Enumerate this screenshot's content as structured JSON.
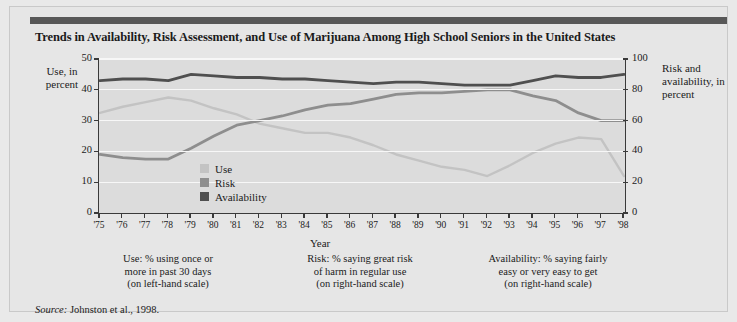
{
  "title": "Trends in Availability, Risk Assessment, and Use of Marijuana Among High School Seniors in the United States",
  "source_prefix": "Source:",
  "source_text": "Johnston et al., 1998.",
  "axis": {
    "left_label": "Use, in percent",
    "right_label": "Risk and availability, in percent",
    "x_label": "Year"
  },
  "legend": [
    {
      "label": "Use",
      "color": "#c3c3c3"
    },
    {
      "label": "Risk",
      "color": "#8e8e8e"
    },
    {
      "label": "Availability",
      "color": "#4f4f4f"
    }
  ],
  "captions": [
    "Use: % using once or more in past 30 days (on left-hand scale)",
    "Risk: % saying great risk of harm in regular use (on right-hand scale)",
    "Availability: % saying fairly easy or very easy to get (on right-hand scale)"
  ],
  "caption_lines": [
    [
      "Use: % using once or",
      "more in past 30 days",
      "(on left-hand scale)"
    ],
    [
      "Risk: % saying great risk",
      "of harm in regular use",
      "(on right-hand scale)"
    ],
    [
      "Availability: % saying fairly",
      "easy or very easy to get",
      "(on right-hand scale)"
    ]
  ],
  "chart_data": {
    "type": "line",
    "title": "Trends in Availability, Risk Assessment, and Use of Marijuana Among High School Seniors in the United States",
    "xlabel": "Year",
    "ylabel": "Use, in percent",
    "ylabel_right": "Risk and availability, in percent",
    "grid": true,
    "legend_position": "inside-center-left",
    "categories": [
      "'75",
      "'76",
      "'77",
      "'78",
      "'79",
      "'80",
      "'81",
      "'82",
      "'83",
      "'84",
      "'85",
      "'86",
      "'87",
      "'88",
      "'89",
      "'90",
      "'91",
      "'92",
      "'93",
      "'94",
      "'95",
      "'96",
      "'97",
      "'98"
    ],
    "x_tick_labels": [
      "'75",
      "'76",
      "'77",
      "'78",
      "'79",
      "'80",
      "'81",
      "'82",
      "'83",
      "'84",
      "'85",
      "'86",
      "'87",
      "'88",
      "'89",
      "'90",
      "'91",
      "'92",
      "'93",
      "'94",
      "'95",
      "'96",
      "'97",
      "'98"
    ],
    "ylim": [
      0,
      50
    ],
    "y_ticks": [
      0,
      10,
      20,
      30,
      40,
      50
    ],
    "ylim_right": [
      0,
      100
    ],
    "y_ticks_right": [
      0,
      20,
      40,
      60,
      80,
      100
    ],
    "series": [
      {
        "name": "Use",
        "axis": "left",
        "color": "#c3c3c3",
        "values": [
          32.5,
          34.5,
          36.0,
          37.5,
          36.5,
          34.0,
          32.0,
          29.0,
          27.5,
          26.0,
          26.0,
          24.5,
          22.0,
          19.0,
          17.0,
          15.0,
          14.0,
          12.0,
          15.5,
          19.5,
          22.5,
          24.5,
          24.0,
          12.0
        ]
      },
      {
        "name": "Risk",
        "axis": "right",
        "color": "#8e8e8e",
        "values": [
          38,
          36,
          35,
          35,
          42,
          50,
          57,
          60,
          63,
          67,
          70,
          71,
          74,
          77,
          78,
          78,
          79,
          80,
          80,
          76,
          73,
          65,
          60,
          60
        ]
      },
      {
        "name": "Availability",
        "axis": "right",
        "color": "#4f4f4f",
        "values": [
          86,
          87,
          87,
          86,
          90,
          89,
          88,
          88,
          87,
          87,
          86,
          85,
          84,
          85,
          85,
          84,
          83,
          83,
          83,
          86,
          89,
          88,
          88,
          90
        ]
      }
    ]
  }
}
